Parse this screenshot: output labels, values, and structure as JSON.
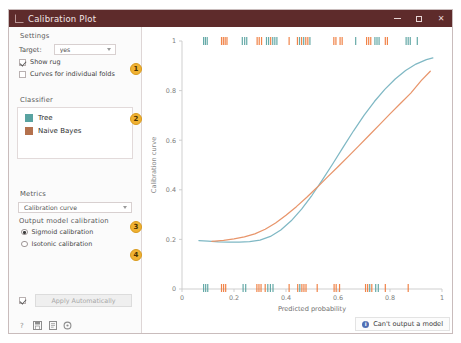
{
  "window": {
    "title": "Calibration Plot",
    "minimize_label": "–",
    "maximize_label": "□",
    "close_label": "✕"
  },
  "sidebar": {
    "settings": {
      "group_title": "Settings",
      "target_label": "Target:",
      "target_value": "yes",
      "show_rug_label": "Show rug",
      "show_rug_checked": true,
      "folds_label": "Curves for individual folds",
      "folds_checked": false
    },
    "classifier": {
      "group_title": "Classifier",
      "items": [
        {
          "label": "Tree",
          "color": "#59a3a1"
        },
        {
          "label": "Naive Bayes",
          "color": "#b4714d"
        }
      ]
    },
    "metrics": {
      "group_title": "Metrics",
      "curve_value": "Calibration curve",
      "output_label": "Output model calibration",
      "options": [
        {
          "label": "Sigmoid calibration",
          "selected": true
        },
        {
          "label": "Isotonic calibration",
          "selected": false
        }
      ]
    },
    "apply": {
      "checked": true,
      "button_label": "Apply Automatically"
    },
    "bottom_icons": [
      {
        "name": "help-icon",
        "glyph": "?"
      },
      {
        "name": "save-icon",
        "glyph": "▣"
      },
      {
        "name": "report-icon",
        "glyph": "▤"
      },
      {
        "name": "settings-icon",
        "glyph": "⚙"
      }
    ],
    "badges": [
      "1",
      "2",
      "3",
      "4"
    ],
    "badge_color": "#f0b232"
  },
  "status": {
    "icon": "info-icon",
    "text": "Can't output a model",
    "icon_color": "#4f6fb5"
  },
  "chart_data": {
    "type": "line",
    "title": "",
    "xlabel": "Predicted probability",
    "ylabel": "Calibration curve",
    "xlim": [
      0,
      1
    ],
    "ylim": [
      0,
      1
    ],
    "xticks": [
      "0",
      "0.2",
      "0.4",
      "0.6",
      "0.8",
      "1"
    ],
    "yticks": [
      "0",
      "0.2",
      "0.4",
      "0.6",
      "0.8",
      "1"
    ],
    "xtick_values": [
      0,
      0.2,
      0.4,
      0.6,
      0.8,
      1
    ],
    "ytick_values": [
      0,
      0.2,
      0.4,
      0.6,
      0.8,
      1
    ],
    "grid": false,
    "legend": "sidebar",
    "series": [
      {
        "name": "Tree",
        "color": "#7fb8c4",
        "x": [
          0.065,
          0.1,
          0.14,
          0.18,
          0.22,
          0.26,
          0.3,
          0.34,
          0.38,
          0.42,
          0.46,
          0.5,
          0.54,
          0.58,
          0.62,
          0.66,
          0.7,
          0.74,
          0.78,
          0.82,
          0.86,
          0.9,
          0.94,
          0.965
        ],
        "y": [
          0.195,
          0.193,
          0.19,
          0.189,
          0.189,
          0.191,
          0.197,
          0.212,
          0.238,
          0.275,
          0.322,
          0.378,
          0.44,
          0.505,
          0.572,
          0.638,
          0.7,
          0.756,
          0.805,
          0.847,
          0.881,
          0.907,
          0.925,
          0.932
        ]
      },
      {
        "name": "Naive Bayes",
        "color": "#e8956b",
        "x": [
          0.115,
          0.16,
          0.2,
          0.24,
          0.28,
          0.32,
          0.36,
          0.4,
          0.44,
          0.48,
          0.52,
          0.56,
          0.6,
          0.64,
          0.68,
          0.72,
          0.76,
          0.8,
          0.84,
          0.88,
          0.92,
          0.955
        ],
        "y": [
          0.192,
          0.196,
          0.202,
          0.21,
          0.222,
          0.241,
          0.266,
          0.297,
          0.332,
          0.37,
          0.41,
          0.452,
          0.493,
          0.535,
          0.577,
          0.62,
          0.663,
          0.706,
          0.748,
          0.79,
          0.84,
          0.878
        ]
      }
    ],
    "rug_top": {
      "y_position": 1.0,
      "ticks": [
        {
          "x": 0.083,
          "c": "t"
        },
        {
          "x": 0.09,
          "c": "t"
        },
        {
          "x": 0.097,
          "c": "t"
        },
        {
          "x": 0.152,
          "c": "o"
        },
        {
          "x": 0.159,
          "c": "o"
        },
        {
          "x": 0.166,
          "c": "o"
        },
        {
          "x": 0.173,
          "c": "o"
        },
        {
          "x": 0.232,
          "c": "t"
        },
        {
          "x": 0.241,
          "c": "t"
        },
        {
          "x": 0.249,
          "c": "t"
        },
        {
          "x": 0.289,
          "c": "o"
        },
        {
          "x": 0.297,
          "c": "o"
        },
        {
          "x": 0.306,
          "c": "o"
        },
        {
          "x": 0.325,
          "c": "t"
        },
        {
          "x": 0.333,
          "c": "t"
        },
        {
          "x": 0.341,
          "c": "o"
        },
        {
          "x": 0.349,
          "c": "t"
        },
        {
          "x": 0.357,
          "c": "t"
        },
        {
          "x": 0.365,
          "c": "t"
        },
        {
          "x": 0.412,
          "c": "o"
        },
        {
          "x": 0.444,
          "c": "o"
        },
        {
          "x": 0.452,
          "c": "t"
        },
        {
          "x": 0.46,
          "c": "o"
        },
        {
          "x": 0.468,
          "c": "t"
        },
        {
          "x": 0.476,
          "c": "o"
        },
        {
          "x": 0.484,
          "c": "o"
        },
        {
          "x": 0.492,
          "c": "t"
        },
        {
          "x": 0.584,
          "c": "o"
        },
        {
          "x": 0.592,
          "c": "o"
        },
        {
          "x": 0.608,
          "c": "o"
        },
        {
          "x": 0.616,
          "c": "o"
        },
        {
          "x": 0.668,
          "c": "t"
        },
        {
          "x": 0.71,
          "c": "o"
        },
        {
          "x": 0.718,
          "c": "o"
        },
        {
          "x": 0.726,
          "c": "o"
        },
        {
          "x": 0.742,
          "c": "t"
        },
        {
          "x": 0.75,
          "c": "t"
        },
        {
          "x": 0.758,
          "c": "t"
        },
        {
          "x": 0.782,
          "c": "o"
        },
        {
          "x": 0.79,
          "c": "o"
        },
        {
          "x": 0.862,
          "c": "t"
        },
        {
          "x": 0.87,
          "c": "t"
        },
        {
          "x": 0.878,
          "c": "t"
        },
        {
          "x": 0.905,
          "c": "t"
        }
      ]
    },
    "rug_bottom": {
      "y_position": 0.0,
      "ticks": [
        {
          "x": 0.083,
          "c": "t"
        },
        {
          "x": 0.091,
          "c": "t"
        },
        {
          "x": 0.099,
          "c": "t"
        },
        {
          "x": 0.152,
          "c": "o"
        },
        {
          "x": 0.16,
          "c": "o"
        },
        {
          "x": 0.168,
          "c": "o"
        },
        {
          "x": 0.235,
          "c": "t"
        },
        {
          "x": 0.245,
          "c": "t"
        },
        {
          "x": 0.288,
          "c": "o"
        },
        {
          "x": 0.296,
          "c": "o"
        },
        {
          "x": 0.304,
          "c": "o"
        },
        {
          "x": 0.32,
          "c": "o"
        },
        {
          "x": 0.33,
          "c": "t"
        },
        {
          "x": 0.34,
          "c": "t"
        },
        {
          "x": 0.35,
          "c": "t"
        },
        {
          "x": 0.412,
          "c": "o"
        },
        {
          "x": 0.445,
          "c": "o"
        },
        {
          "x": 0.453,
          "c": "t"
        },
        {
          "x": 0.461,
          "c": "o"
        },
        {
          "x": 0.469,
          "c": "o"
        },
        {
          "x": 0.477,
          "c": "o"
        },
        {
          "x": 0.52,
          "c": "o"
        },
        {
          "x": 0.585,
          "c": "o"
        },
        {
          "x": 0.593,
          "c": "o"
        },
        {
          "x": 0.606,
          "c": "o"
        },
        {
          "x": 0.706,
          "c": "o"
        },
        {
          "x": 0.714,
          "c": "o"
        },
        {
          "x": 0.722,
          "c": "t"
        },
        {
          "x": 0.73,
          "c": "o"
        },
        {
          "x": 0.745,
          "c": "t"
        },
        {
          "x": 0.755,
          "c": "t"
        },
        {
          "x": 0.782,
          "c": "o"
        },
        {
          "x": 0.87,
          "c": "o"
        }
      ]
    },
    "rug_colors": {
      "t": "#59a3a1",
      "o": "#f07a3a"
    }
  }
}
